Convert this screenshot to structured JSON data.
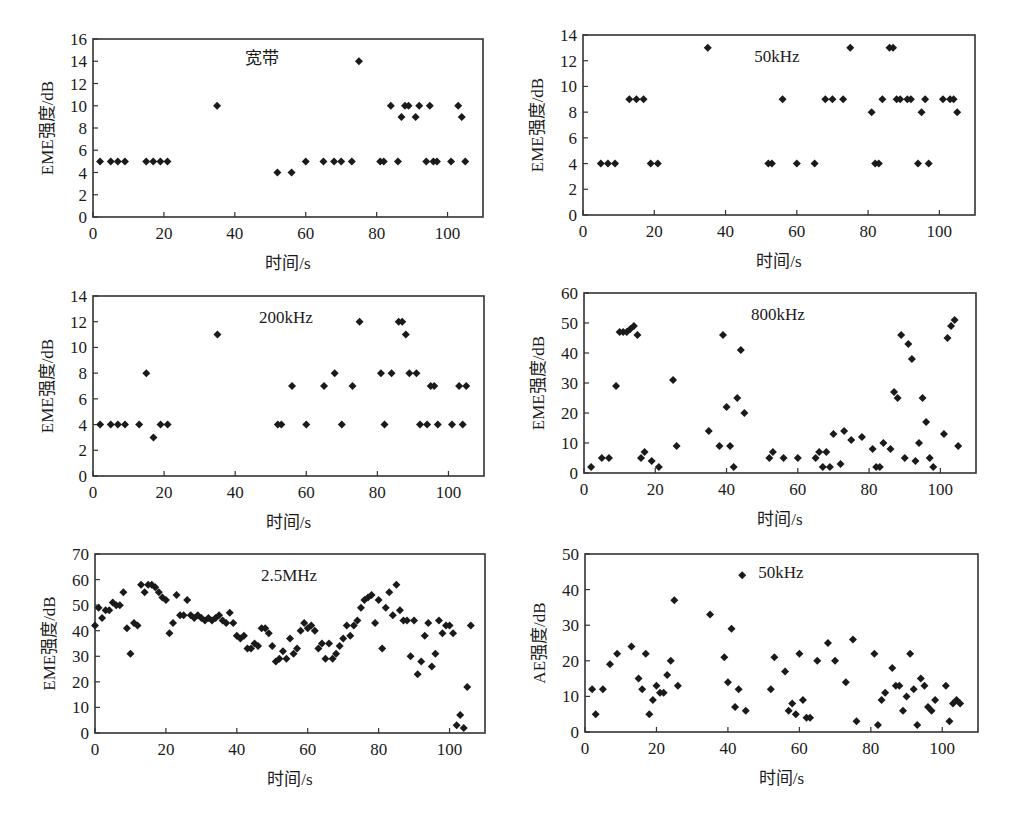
{
  "figure": {
    "marker_color": "#1a1a1a",
    "frame_color": "#333333"
  },
  "chart_data": [
    {
      "type": "scatter",
      "title": "宽带",
      "xlabel": "时间/s",
      "ylabel": "EME强度/dB",
      "xlim": [
        0,
        110
      ],
      "ylim": [
        0,
        16
      ],
      "xticks": [
        0,
        20,
        40,
        60,
        80,
        100
      ],
      "yticks": [
        0,
        2,
        4,
        6,
        8,
        10,
        12,
        14,
        16
      ],
      "grid": false,
      "legend": null,
      "frame": {
        "left": 93,
        "top": 39,
        "right": 483,
        "bottom": 217
      },
      "title_pos": {
        "x": 262,
        "y": 64
      },
      "x": [
        2,
        5,
        7,
        9,
        15,
        17,
        19,
        21,
        35,
        52,
        56,
        60,
        65,
        68,
        70,
        73,
        75,
        81,
        82,
        84,
        86,
        87,
        88,
        89,
        91,
        92,
        94,
        95,
        96,
        97,
        101,
        103,
        104,
        105
      ],
      "y": [
        5,
        5,
        5,
        5,
        5,
        5,
        5,
        5,
        10,
        4,
        4,
        5,
        5,
        5,
        5,
        5,
        14,
        5,
        5,
        10,
        5,
        9,
        10,
        10,
        9,
        10,
        5,
        10,
        5,
        5,
        5,
        10,
        9,
        5
      ]
    },
    {
      "type": "scatter",
      "title": "50kHz",
      "xlabel": "时间/s",
      "ylabel": "EME强度/dB",
      "xlim": [
        0,
        110
      ],
      "ylim": [
        0,
        14
      ],
      "xticks": [
        0,
        20,
        40,
        60,
        80,
        100
      ],
      "yticks": [
        0,
        2,
        4,
        6,
        8,
        10,
        12,
        14
      ],
      "grid": false,
      "legend": null,
      "frame": {
        "left": 583,
        "top": 35,
        "right": 975,
        "bottom": 215
      },
      "title_pos": {
        "x": 777,
        "y": 62
      },
      "x": [
        5,
        7,
        9,
        13,
        15,
        17,
        19,
        21,
        35,
        52,
        53,
        56,
        60,
        65,
        68,
        70,
        73,
        75,
        81,
        82,
        83,
        84,
        86,
        87,
        88,
        89,
        91,
        92,
        94,
        95,
        96,
        97,
        101,
        103,
        104,
        105
      ],
      "y": [
        4,
        4,
        4,
        9,
        9,
        9,
        4,
        4,
        13,
        4,
        4,
        9,
        4,
        4,
        9,
        9,
        9,
        13,
        8,
        4,
        4,
        9,
        13,
        13,
        9,
        9,
        9,
        9,
        4,
        8,
        9,
        4,
        9,
        9,
        9,
        8
      ]
    },
    {
      "type": "scatter",
      "title": "200kHz",
      "xlabel": "时间/s",
      "ylabel": "EME强度/dB",
      "xlim": [
        0,
        110
      ],
      "ylim": [
        0,
        14
      ],
      "xticks": [
        0,
        20,
        40,
        60,
        80,
        100
      ],
      "yticks": [
        0,
        2,
        4,
        6,
        8,
        10,
        12,
        14
      ],
      "grid": false,
      "legend": null,
      "frame": {
        "left": 93,
        "top": 296,
        "right": 484,
        "bottom": 476
      },
      "title_pos": {
        "x": 286,
        "y": 323
      },
      "x": [
        2,
        5,
        7,
        9,
        13,
        15,
        17,
        19,
        21,
        35,
        52,
        53,
        56,
        60,
        65,
        68,
        70,
        73,
        75,
        81,
        82,
        84,
        86,
        87,
        88,
        89,
        91,
        92,
        94,
        95,
        96,
        97,
        101,
        103,
        104,
        105
      ],
      "y": [
        4,
        4,
        4,
        4,
        4,
        8,
        3,
        4,
        4,
        11,
        4,
        4,
        7,
        4,
        7,
        8,
        4,
        7,
        12,
        8,
        4,
        8,
        12,
        12,
        11,
        8,
        8,
        4,
        4,
        7,
        7,
        4,
        4,
        7,
        4,
        7
      ]
    },
    {
      "type": "scatter",
      "title": "800kHz",
      "xlabel": "时间/s",
      "ylabel": "EME强度/dB",
      "xlim": [
        0,
        110
      ],
      "ylim": [
        0,
        60
      ],
      "xticks": [
        0,
        20,
        40,
        60,
        80,
        100
      ],
      "yticks": [
        0,
        10,
        20,
        30,
        40,
        50,
        60
      ],
      "grid": false,
      "legend": null,
      "frame": {
        "left": 584,
        "top": 293,
        "right": 976,
        "bottom": 473
      },
      "title_pos": {
        "x": 778,
        "y": 320
      },
      "x": [
        2,
        5,
        7,
        9,
        10,
        11,
        12,
        13,
        14,
        15,
        16,
        17,
        19,
        21,
        25,
        26,
        35,
        38,
        39,
        40,
        41,
        42,
        43,
        44,
        45,
        52,
        53,
        56,
        60,
        65,
        66,
        67,
        68,
        69,
        70,
        72,
        73,
        75,
        78,
        81,
        82,
        83,
        84,
        86,
        87,
        88,
        89,
        90,
        91,
        92,
        93,
        94,
        95,
        96,
        97,
        98,
        101,
        102,
        103,
        104,
        105
      ],
      "y": [
        2,
        5,
        5,
        29,
        47,
        47,
        47,
        48,
        49,
        46,
        5,
        7,
        4,
        2,
        31,
        9,
        14,
        9,
        46,
        22,
        9,
        2,
        25,
        41,
        20,
        5,
        7,
        5,
        5,
        5,
        7,
        2,
        7,
        2,
        13,
        3,
        14,
        11,
        12,
        8,
        2,
        2,
        10,
        8,
        27,
        25,
        46,
        5,
        43,
        38,
        4,
        10,
        25,
        17,
        5,
        2,
        13,
        45,
        49,
        51,
        9
      ]
    },
    {
      "type": "scatter",
      "title": "2.5MHz",
      "xlabel": "时间/s",
      "ylabel": "EME强度/dB",
      "xlim": [
        0,
        110
      ],
      "ylim": [
        0,
        70
      ],
      "xticks": [
        0,
        20,
        40,
        60,
        80,
        100
      ],
      "yticks": [
        0,
        10,
        20,
        30,
        40,
        50,
        60,
        70
      ],
      "grid": false,
      "legend": null,
      "frame": {
        "left": 95,
        "top": 554,
        "right": 485,
        "bottom": 733
      },
      "title_pos": {
        "x": 289,
        "y": 581
      },
      "x": [
        0,
        1,
        2,
        3,
        4,
        5,
        6,
        7,
        8,
        9,
        10,
        11,
        12,
        13,
        14,
        15,
        16,
        17,
        18,
        19,
        20,
        21,
        22,
        23,
        24,
        25,
        26,
        27,
        28,
        29,
        30,
        31,
        32,
        33,
        34,
        35,
        36,
        37,
        38,
        39,
        40,
        41,
        42,
        43,
        44,
        45,
        46,
        47,
        48,
        49,
        50,
        51,
        52,
        53,
        54,
        55,
        56,
        57,
        58,
        59,
        60,
        61,
        62,
        63,
        64,
        65,
        66,
        67,
        68,
        69,
        70,
        71,
        72,
        73,
        74,
        75,
        76,
        77,
        78,
        79,
        80,
        81,
        82,
        83,
        84,
        85,
        86,
        87,
        88,
        89,
        90,
        91,
        92,
        93,
        94,
        95,
        96,
        97,
        98,
        99,
        100,
        101,
        102,
        103,
        104,
        105,
        106
      ],
      "y": [
        42,
        49,
        45,
        48,
        48,
        51,
        50,
        50,
        55,
        41,
        31,
        43,
        42,
        58,
        55,
        58,
        58,
        57,
        55,
        53,
        52,
        39,
        43,
        54,
        46,
        46,
        52,
        46,
        45,
        46,
        45,
        44,
        45,
        44,
        45,
        46,
        44,
        43,
        47,
        43,
        38,
        37,
        38,
        33,
        33,
        35,
        34,
        41,
        41,
        39,
        34,
        28,
        29,
        32,
        29,
        37,
        31,
        33,
        40,
        43,
        41,
        42,
        40,
        33,
        35,
        29,
        35,
        29,
        31,
        34,
        37,
        42,
        38,
        42,
        44,
        49,
        52,
        53,
        54,
        43,
        52,
        33,
        49,
        55,
        46,
        58,
        48,
        44,
        44,
        30,
        44,
        23,
        28,
        38,
        43,
        26,
        31,
        44,
        39,
        42,
        42,
        39,
        3,
        7,
        2,
        18,
        42
      ]
    },
    {
      "type": "scatter",
      "title": "50kHz",
      "xlabel": "时间/s",
      "ylabel": "AE强度/dB",
      "xlim": [
        0,
        110
      ],
      "ylim": [
        0,
        50
      ],
      "xticks": [
        0,
        20,
        40,
        60,
        80,
        100
      ],
      "yticks": [
        0,
        10,
        20,
        30,
        40,
        50
      ],
      "grid": false,
      "legend": null,
      "frame": {
        "left": 585,
        "top": 554,
        "right": 978,
        "bottom": 732
      },
      "title_pos": {
        "x": 781,
        "y": 578
      },
      "x": [
        2,
        3,
        5,
        7,
        9,
        13,
        15,
        16,
        17,
        18,
        19,
        20,
        21,
        22,
        23,
        24,
        25,
        26,
        35,
        39,
        40,
        41,
        42,
        43,
        44,
        45,
        52,
        53,
        56,
        57,
        58,
        59,
        60,
        61,
        62,
        63,
        65,
        68,
        70,
        73,
        75,
        76,
        81,
        82,
        83,
        84,
        86,
        87,
        88,
        89,
        90,
        91,
        92,
        93,
        94,
        95,
        96,
        97,
        98,
        101,
        102,
        103,
        104,
        105
      ],
      "y": [
        12,
        5,
        12,
        19,
        22,
        24,
        15,
        12,
        22,
        5,
        9,
        13,
        11,
        11,
        16,
        20,
        37,
        13,
        33,
        21,
        14,
        29,
        7,
        12,
        44,
        6,
        12,
        21,
        17,
        6,
        8,
        5,
        22,
        9,
        4,
        4,
        20,
        25,
        20,
        14,
        26,
        3,
        22,
        2,
        9,
        11,
        18,
        13,
        13,
        6,
        10,
        22,
        12,
        2,
        15,
        13,
        7,
        6,
        9,
        13,
        3,
        8,
        9,
        8
      ]
    }
  ]
}
